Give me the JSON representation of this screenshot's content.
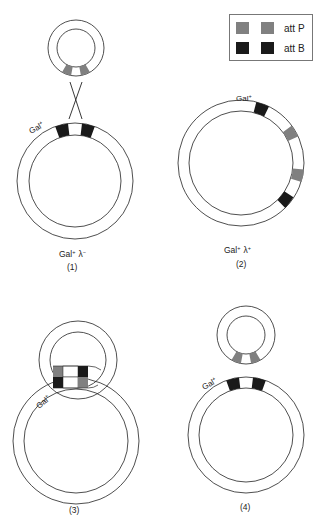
{
  "legend": {
    "items": [
      {
        "label": "att P",
        "color": "#808080"
      },
      {
        "label": "att B",
        "color": "#1a1a1a"
      }
    ]
  },
  "colors": {
    "attP": "#808080",
    "attB": "#1a1a1a",
    "outline": "#222222",
    "background": "#ffffff"
  },
  "panels": [
    {
      "number": "(1)",
      "genotype_gal": "Gal",
      "genotype_gal_sup": "+",
      "genotype_lambda": "λ",
      "genotype_lambda_sup": "−",
      "gal_label": "Gal",
      "gal_sup": "+"
    },
    {
      "number": "(2)",
      "genotype_gal": "Gal",
      "genotype_gal_sup": "+",
      "genotype_lambda": "λ",
      "genotype_lambda_sup": "+",
      "gal_label": "Gal",
      "gal_sup": "+"
    },
    {
      "number": "(3)",
      "gal_label": "Gal",
      "gal_sup": "+"
    },
    {
      "number": "(4)",
      "gal_label": "Gal",
      "gal_sup": "+"
    }
  ]
}
